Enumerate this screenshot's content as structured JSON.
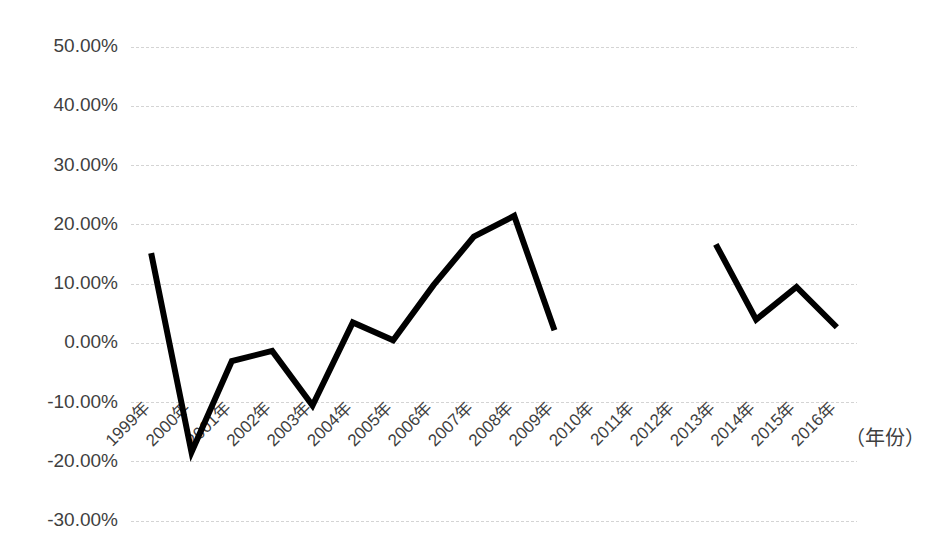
{
  "chart_data": {
    "type": "line",
    "title": "",
    "subtitle": "",
    "xlabel": "（年份）",
    "ylabel": "",
    "categories": [
      "1999年",
      "2000年",
      "2001年",
      "2002年",
      "2003年",
      "2004年",
      "2005年",
      "2006年",
      "2007年",
      "2008年",
      "2009年",
      "2010年",
      "2011年",
      "2012年",
      "2013年",
      "2014年",
      "2015年",
      "2016年"
    ],
    "x_values": [
      1999,
      2000,
      2001,
      2002,
      2003,
      2004,
      2005,
      2006,
      2007,
      2008,
      2009,
      2010,
      2011,
      2012,
      2013,
      2014,
      2015,
      2016
    ],
    "series": [
      {
        "name": "增长率",
        "values": [
          15.2,
          -18.4,
          -3.0,
          -1.3,
          -10.5,
          3.5,
          0.5,
          9.8,
          18.0,
          21.5,
          2.2,
          null,
          42.0,
          null,
          16.7,
          4.0,
          9.5,
          2.7
        ]
      }
    ],
    "ytick_labels": [
      "50.00%",
      "40.00%",
      "30.00%",
      "20.00%",
      "10.00%",
      "0.00%",
      "-10.00%",
      "-20.00%",
      "-30.00%"
    ],
    "ytick_values": [
      50,
      40,
      30,
      20,
      10,
      0,
      -10,
      -20,
      -30
    ],
    "ylim": [
      -30,
      50
    ],
    "grid": true,
    "grid_axis": "y",
    "legend": false,
    "legend_position": "none",
    "line_color": "#000000",
    "grid_color": "#d4d4d4",
    "text_color": "#3f3f3f",
    "background_color": "#ffffff",
    "xtick_rotation": -45,
    "annotations": []
  },
  "layout": {
    "plot_left": 131,
    "plot_right": 857,
    "plot_top": 47,
    "plot_bottom": 521,
    "xlabel_x": 845,
    "xlabel_y": 440
  }
}
